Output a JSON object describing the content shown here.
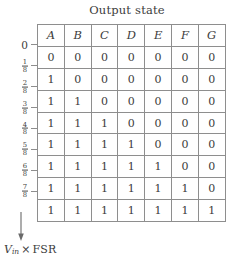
{
  "chart_data": {
    "type": "table",
    "title": "Output state",
    "xlabel": "",
    "ylabel": "Vin × FSR",
    "columns": [
      "A",
      "B",
      "C",
      "D",
      "E",
      "F",
      "G"
    ],
    "rows": [
      [
        "0",
        "0",
        "0",
        "0",
        "0",
        "0",
        "0"
      ],
      [
        "1",
        "0",
        "0",
        "0",
        "0",
        "0",
        "0"
      ],
      [
        "1",
        "1",
        "0",
        "0",
        "0",
        "0",
        "0"
      ],
      [
        "1",
        "1",
        "1",
        "0",
        "0",
        "0",
        "0"
      ],
      [
        "1",
        "1",
        "1",
        "1",
        "0",
        "0",
        "0"
      ],
      [
        "1",
        "1",
        "1",
        "1",
        "1",
        "0",
        "0"
      ],
      [
        "1",
        "1",
        "1",
        "1",
        "1",
        "1",
        "0"
      ],
      [
        "1",
        "1",
        "1",
        "1",
        "1",
        "1",
        "1"
      ]
    ],
    "y_tick_labels": [
      "0",
      "1/8",
      "2/8",
      "3/8",
      "4/8",
      "5/8",
      "6/8",
      "7/8"
    ],
    "y_ticks": [
      {
        "label": "0",
        "numerator": "",
        "denominator": ""
      },
      {
        "label": "1/8",
        "numerator": "1",
        "denominator": "8"
      },
      {
        "label": "2/8",
        "numerator": "2",
        "denominator": "8"
      },
      {
        "label": "3/8",
        "numerator": "3",
        "denominator": "8"
      },
      {
        "label": "4/8",
        "numerator": "4",
        "denominator": "8"
      },
      {
        "label": "5/8",
        "numerator": "5",
        "denominator": "8"
      },
      {
        "label": "6/8",
        "numerator": "6",
        "denominator": "8"
      },
      {
        "label": "7/8",
        "numerator": "7",
        "denominator": "8"
      }
    ],
    "grid": true,
    "legend": "none",
    "annotation": "Vin × FSR",
    "colors": {
      "grid_line": "#8e8e8e",
      "text": "#3c3c3c",
      "background": "#ffffff"
    }
  },
  "caption": {
    "variable": "V",
    "subscript": "in",
    "operator": "×",
    "unit": "FSR"
  }
}
